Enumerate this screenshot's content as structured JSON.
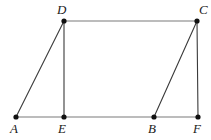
{
  "figure": {
    "width": 211,
    "height": 140,
    "background_color": "#ffffff",
    "stroke_color_light": "#7a7a7a",
    "stroke_color_dark": "#3a3a3a",
    "point_color": "#111111",
    "label_color": "#1a1a1a",
    "point_radius": 2.6,
    "stroke_width": 1.1
  },
  "points": [
    {
      "id": "A",
      "label": "A",
      "x": 16,
      "y": 117,
      "label_x": 10,
      "label_y": 122
    },
    {
      "id": "E",
      "label": "E",
      "x": 64,
      "y": 117,
      "label_x": 58,
      "label_y": 122
    },
    {
      "id": "B",
      "label": "B",
      "x": 154,
      "y": 117,
      "label_x": 148,
      "label_y": 122
    },
    {
      "id": "F",
      "label": "F",
      "x": 198,
      "y": 117,
      "label_x": 193,
      "label_y": 122
    },
    {
      "id": "D",
      "label": "D",
      "x": 64,
      "y": 21,
      "label_x": 57,
      "label_y": 3
    },
    {
      "id": "C",
      "label": "C",
      "x": 197,
      "y": 21,
      "label_x": 199,
      "label_y": 3
    }
  ],
  "segments": [
    {
      "id": "AD",
      "from": "A",
      "to": "D",
      "x1": 16,
      "y1": 117,
      "x2": 64,
      "y2": 21,
      "shade": "dark"
    },
    {
      "id": "DC",
      "from": "D",
      "to": "C",
      "x1": 64,
      "y1": 21,
      "x2": 197,
      "y2": 21,
      "shade": "light"
    },
    {
      "id": "DE",
      "from": "D",
      "to": "E",
      "x1": 64,
      "y1": 21,
      "x2": 64,
      "y2": 117,
      "shade": "dark"
    },
    {
      "id": "BC",
      "from": "B",
      "to": "C",
      "x1": 154,
      "y1": 117,
      "x2": 197,
      "y2": 21,
      "shade": "dark"
    },
    {
      "id": "CF",
      "from": "C",
      "to": "F",
      "x1": 197,
      "y1": 21,
      "x2": 198,
      "y2": 117,
      "shade": "dark"
    },
    {
      "id": "AF",
      "from": "A",
      "to": "F",
      "x1": 16,
      "y1": 117,
      "x2": 198,
      "y2": 117,
      "shade": "light"
    }
  ]
}
